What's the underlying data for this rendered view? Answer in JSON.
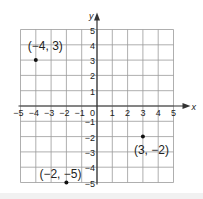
{
  "figure": {
    "title": "",
    "axes": {
      "x_label": "x",
      "y_label": "y",
      "x_range": [
        -5,
        5
      ],
      "y_range": [
        -5,
        5
      ],
      "x_ticks": [
        "-5",
        "-4",
        "-3",
        "-2",
        "-1",
        "1",
        "2",
        "3",
        "4",
        "5"
      ],
      "y_ticks": [
        "5",
        "4",
        "3",
        "2",
        "1",
        "-1",
        "-2",
        "-3",
        "-4",
        "-5"
      ],
      "origin_label": "0"
    },
    "points": [
      {
        "x": -4,
        "y": 3,
        "label": "(−4, 3)"
      },
      {
        "x": 3,
        "y": -2,
        "label": "(3, −2)"
      },
      {
        "x": -2,
        "y": -5,
        "label": "(−2, −5)"
      }
    ],
    "colors": {
      "grid": "#9a9a9a",
      "axis": "#333333",
      "point": "#111111",
      "text": "#222222"
    }
  }
}
